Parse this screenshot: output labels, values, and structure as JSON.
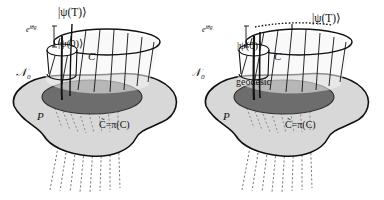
{
  "figure": {
    "panel_count": 2,
    "background_color": "#ffffff",
    "ink_color": "#111111",
    "blob_fill": "#d8d8d8",
    "ellipse_fill": "#6d6d6d",
    "cylinder_fill": "#f2f2f2"
  },
  "panels": [
    {
      "id": "left",
      "name": "open-curve-panel",
      "labels": {
        "psi_T": "|ψ(T)⟩",
        "psi_0": "|ψ(0)⟩",
        "phase": "e",
        "phase_sup": "iθg",
        "curve_C": "C",
        "fiber_N0": "𝒩",
        "fiber_N0_sub": "0",
        "base_P": "P",
        "projection": "C̃=π(C)"
      }
    },
    {
      "id": "right",
      "name": "geodesic-panel",
      "labels": {
        "psi_T": "|ψ(T)⟩",
        "psi_0": "|ψ(0)⟩",
        "phase": "e",
        "phase_sup": "iθg",
        "curve_C": "C",
        "geodesic": "geodesic",
        "fiber_N0": "𝒩",
        "fiber_N0_sub": "0",
        "base_P": "P",
        "projection": "C̃=π(C)"
      }
    }
  ]
}
